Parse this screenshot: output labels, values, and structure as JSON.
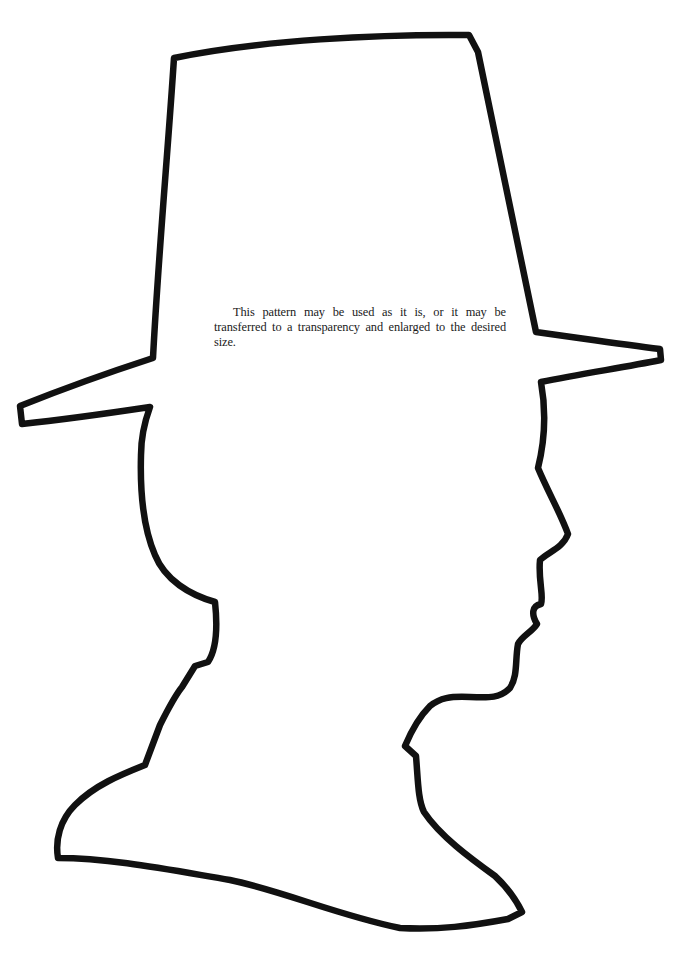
{
  "page": {
    "caption": "This pattern may be used as it is, or it may be transferred to a transparency and enlarged to the desired size.",
    "figure": {
      "subject": "silhouette-outline-man-in-tall-hat",
      "stroke_color": "#111111",
      "background_color": "#ffffff"
    }
  }
}
